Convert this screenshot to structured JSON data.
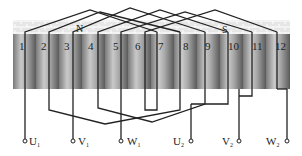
{
  "diagram": {
    "title": "",
    "type": "three-phase stator winding diagram",
    "slots": [
      "1",
      "2",
      "3",
      "4",
      "5",
      "6",
      "7",
      "8",
      "9",
      "10",
      "11",
      "12"
    ],
    "poles": [
      {
        "label": "N",
        "slot_position": 4
      },
      {
        "label": "S",
        "slot_position": 10
      }
    ],
    "terminals": [
      {
        "label": "U",
        "sub": "1",
        "side": "left"
      },
      {
        "label": "V",
        "sub": "1",
        "side": "left"
      },
      {
        "label": "W",
        "sub": "1",
        "side": "left"
      },
      {
        "label": "U",
        "sub": "2",
        "side": "right"
      },
      {
        "label": "V",
        "sub": "2",
        "side": "right"
      },
      {
        "label": "W",
        "sub": "2",
        "side": "right"
      }
    ],
    "colors": {
      "wire": "#222222",
      "slot_dark": "#6a6a6a",
      "slot_light": "#c8c8c8",
      "band": "#e4e4e4",
      "band_line": "#ffffff"
    }
  }
}
